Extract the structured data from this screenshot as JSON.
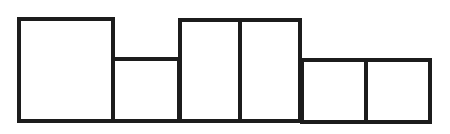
{
  "diagram": {
    "type": "rectangle-row",
    "stroke_color": "#1c1c1c",
    "fill_color": "#ffffff",
    "stroke_width": 4,
    "boxes": [
      {
        "id": "box-1",
        "x": 19,
        "y": 19,
        "w": 94,
        "h": 102,
        "size": "large"
      },
      {
        "id": "box-2",
        "x": 113,
        "y": 59,
        "w": 66,
        "h": 62,
        "size": "small"
      },
      {
        "id": "box-3",
        "x": 180,
        "y": 20,
        "w": 60,
        "h": 101,
        "size": "tall"
      },
      {
        "id": "box-4",
        "x": 240,
        "y": 20,
        "w": 60,
        "h": 101,
        "size": "tall"
      },
      {
        "id": "box-5",
        "x": 302,
        "y": 60,
        "w": 64,
        "h": 62,
        "size": "small"
      },
      {
        "id": "box-6",
        "x": 366,
        "y": 60,
        "w": 64,
        "h": 62,
        "size": "small"
      }
    ]
  }
}
